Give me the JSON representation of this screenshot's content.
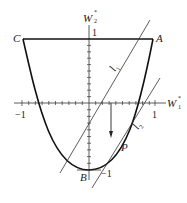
{
  "diagram": {
    "axes": {
      "x_label": "W",
      "x_sup": "*",
      "x_sub": "1",
      "y_label": "W",
      "y_sup": "*",
      "y_sub": "2",
      "x_tick_neg": "−1",
      "x_tick_pos": "1",
      "y_tick_pos": "1",
      "y_tick_neg": "−1"
    },
    "points": {
      "A": "A",
      "B": "B",
      "C": "C",
      "P": "P"
    },
    "lines": {
      "l1": "l",
      "l1_sub": "1",
      "l2": "l",
      "l2_sub": "2"
    },
    "colors": {
      "stroke": "#222222",
      "background": "#ffffff"
    }
  }
}
